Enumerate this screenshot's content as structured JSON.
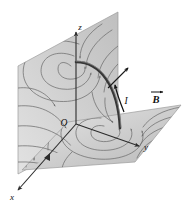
{
  "figure": {
    "background_color": "#ffffff",
    "axes": {
      "origin_label": "O",
      "x_label": "x",
      "y_label": "y",
      "z_label": "z",
      "axis_color": "#2b2b2b"
    },
    "labels": {
      "current": "I",
      "bfield": "B"
    },
    "planes": [
      {
        "name": "vertical-xz-plane",
        "fill_start": "#f2f2f2",
        "fill_end": "#c9c9c9",
        "edge_color": "#9a9a9a"
      },
      {
        "name": "horizontal-xy-plane",
        "fill_start": "#eaeaea",
        "fill_end": "#bdbdbd",
        "edge_color": "#9a9a9a"
      }
    ],
    "wire": {
      "name": "quarter-circle-current-wire",
      "shape": "quarter circle arc from z-axis to y-axis",
      "color": "#3a3a3a"
    },
    "field_lines": {
      "color": "#6d6d6d",
      "style": "closed loops encircling the wire with directional arrowheads"
    }
  }
}
